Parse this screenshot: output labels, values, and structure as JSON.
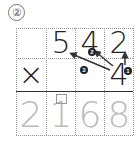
{
  "problem": {
    "label": "②",
    "multiplicand": [
      "5",
      "4",
      "2"
    ],
    "operator": "×",
    "multiplier": "4",
    "result": [
      "2",
      "1",
      "6",
      "8"
    ],
    "step_badges": [
      "❶",
      "❷",
      "❸"
    ]
  }
}
